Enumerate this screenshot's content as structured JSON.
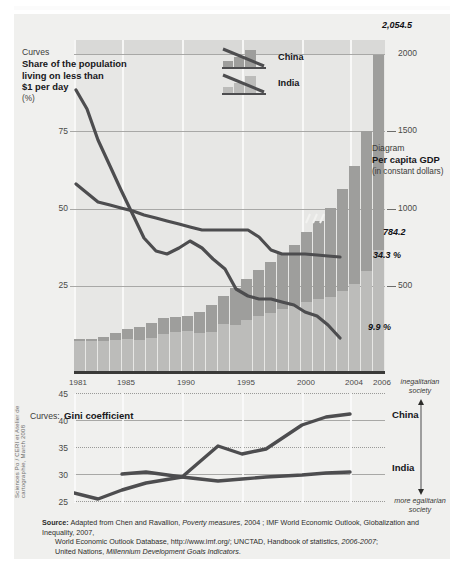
{
  "panel": {
    "top_chart": {
      "caption_kicker": "Curves",
      "caption_title_l1": "Share of the population",
      "caption_title_l2": "living on less than",
      "caption_title_l3": "$1 per day",
      "caption_unit": "(%)",
      "diagram_kicker": "Diagram",
      "diagram_title": "Per capita GDP",
      "diagram_subtitle": "(in constant dollars)",
      "legend": [
        {
          "label": "China",
          "icon": "bar-line-icon"
        },
        {
          "label": "India",
          "icon": "bar-line-icon"
        }
      ],
      "annotations": {
        "peak_gdp": "2,054.5",
        "india_gdp": "784.2",
        "china_poverty_end": "9.9 %",
        "india_poverty_end": "34.3 %"
      }
    },
    "gini_chart": {
      "caption_kicker": "Curves:",
      "caption_title": "Gini coefficient",
      "series_labels": [
        "China",
        "India"
      ],
      "axis_note_top_l1": "inegalitarian",
      "axis_note_top_l2": "society",
      "axis_note_bottom_l1": "more egalitarian",
      "axis_note_bottom_l2": "society"
    },
    "source": {
      "label": "Source:",
      "line1_a": "Adapted from Chen and Ravallion, ",
      "line1_i": "Poverty measures",
      "line1_b": ", 2004 ; IMF World Economic Outlook, Globalization and Inequality, 2007,",
      "line2_a": "World Economic Outlook Database, http://www.imf.org/; UNCTAD, Handbook of statistics, ",
      "line2_i": "2006-2007",
      "line2_b": ";",
      "line3_a": "United Nations, ",
      "line3_i": "Millennium Development Goals Indicators",
      "line3_b": "."
    },
    "credit": "Sciences Po / CERI et Atelier de cartographie, March 2008"
  },
  "colors": {
    "panel_bg": "#f0f0ee",
    "plot_bg": "#e7e7e5",
    "bar_china": "#9e9e9c",
    "bar_india": "#bcbcba",
    "curve": "#4d4d4f",
    "gridline": "#a8a8a6",
    "text": "#17171a"
  },
  "chart_data": [
    {
      "type": "bar",
      "title": "Per capita GDP (in constant dollars) and share of the population living on less than $1 per day",
      "xlabel": "",
      "ylabel": "Share of the population living on less than $1 per day (%)",
      "y2label": "Per capita GDP (in constant dollars)",
      "ylim": [
        0,
        100
      ],
      "y2lim": [
        0,
        2150
      ],
      "yticks": [
        25,
        50,
        75
      ],
      "y2ticks": [
        500,
        1000,
        1500,
        2000
      ],
      "grid": true,
      "legend_position": "top-center",
      "x": [
        1981,
        1982,
        1983,
        1984,
        1985,
        1986,
        1987,
        1988,
        1989,
        1990,
        1991,
        1992,
        1993,
        1994,
        1995,
        1996,
        1997,
        1998,
        1999,
        2000,
        2001,
        2002,
        2003,
        2004,
        2005,
        2006
      ],
      "xtick_labels": [
        "1981",
        "1985",
        "1990",
        "1995",
        "2000",
        "2004",
        "2006"
      ],
      "series": [
        {
          "name": "China",
          "kind": "bar",
          "units": "GDP per capita, constant dollars",
          "values": [
            205,
            208,
            222,
            248,
            272,
            288,
            313,
            345,
            350,
            355,
            385,
            430,
            485,
            540,
            595,
            655,
            710,
            760,
            820,
            900,
            975,
            1060,
            1180,
            1330,
            1560,
            2054.5
          ]
        },
        {
          "name": "India",
          "kind": "bar",
          "units": "GDP per capita, constant dollars",
          "values": [
            196,
            196,
            198,
            203,
            205,
            203,
            212,
            240,
            255,
            262,
            250,
            255,
            305,
            300,
            330,
            355,
            380,
            400,
            425,
            450,
            470,
            480,
            520,
            565,
            650,
            784.2
          ]
        },
        {
          "name": "China",
          "kind": "line",
          "units": "% living on less than $1/day",
          "values": [
            85,
            79,
            68,
            60,
            53,
            44,
            36,
            32,
            31,
            33,
            35,
            33,
            30,
            27,
            22,
            20,
            19,
            19,
            18,
            17,
            15,
            14,
            12,
            9.9,
            null,
            null
          ]
        },
        {
          "name": "India",
          "kind": "line",
          "units": "% living on less than $1/day",
          "values": [
            57,
            54,
            51,
            50,
            49,
            48,
            47,
            46,
            45,
            44,
            43,
            42,
            42,
            42,
            42,
            42,
            40,
            36,
            35,
            35,
            35,
            34.8,
            34.6,
            34.3,
            null,
            null
          ]
        }
      ],
      "data_labels": {
        "China_gdp_2006": 2054.5,
        "India_gdp_2006": 784.2,
        "China_poverty_2004": "9.9 %",
        "India_poverty_2004": "34.3 %"
      }
    },
    {
      "type": "line",
      "title": "Gini coefficient",
      "xlabel": "",
      "ylabel": "Gini coefficient",
      "ylim": [
        24,
        46
      ],
      "yticks": [
        25,
        30,
        35,
        40,
        45
      ],
      "grid": true,
      "legend_position": "right",
      "x": [
        1981,
        1983,
        1985,
        1987,
        1990,
        1993,
        1995,
        1997,
        2000,
        2002,
        2004
      ],
      "series": [
        {
          "name": "China",
          "values": [
            27.9,
            26.7,
            28.3,
            29.5,
            30.6,
            36.7,
            35.1,
            36.2,
            39.5,
            41.1,
            41.6
          ]
        },
        {
          "name": "India",
          "values": [
            null,
            31.2,
            31.5,
            31.7,
            30.6,
            29.9,
            30.3,
            30.6,
            31.0,
            31.3,
            31.6
          ]
        }
      ],
      "annotations": {
        "top": "inegalitarian society",
        "bottom": "more egalitarian society"
      }
    }
  ]
}
